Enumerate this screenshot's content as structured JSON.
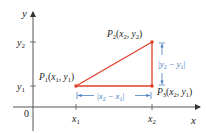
{
  "figure": {
    "axes": {
      "x_label": "x",
      "y_label": "y",
      "origin_label": "0",
      "x_ticks": [
        "x",
        "x"
      ],
      "x_tick_subs": [
        "1",
        "2"
      ],
      "y_ticks": [
        "y",
        "y"
      ],
      "y_tick_subs": [
        "2",
        "1"
      ]
    },
    "points": [
      {
        "name": "P1",
        "label": "P",
        "sub": "1",
        "coords": "(x1, y1)"
      },
      {
        "name": "P2",
        "label": "P",
        "sub": "2",
        "coords": "(x2, y2)"
      },
      {
        "name": "P3",
        "label": "P",
        "sub": "3",
        "coords": "(x2, y1)"
      }
    ],
    "measurements": {
      "horizontal": "|x2 − x1|",
      "vertical": "|y2 − y1|"
    },
    "colors": {
      "triangle": "#e0402a",
      "annotation": "#4a7fc0",
      "axis": "#555555",
      "text": "#222222"
    }
  }
}
